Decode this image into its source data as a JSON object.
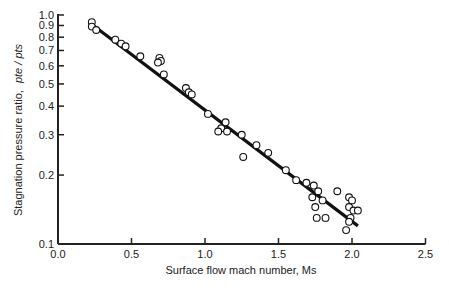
{
  "chart_data": {
    "type": "scatter",
    "title": "",
    "xlabel": "Surface flow mach number,  Ms",
    "ylabel": "Stagnation pressure ratio,  pte / pts",
    "ylabel_main": "Stagnation pressure ratio,",
    "ylabel_sym": "pte / pts",
    "xlim": [
      0,
      2.5
    ],
    "ylim": [
      0.1,
      1.0
    ],
    "yscale": "log",
    "grid": false,
    "legend": null,
    "x_ticks": [
      "0.0",
      "0.5",
      "1.0",
      "1.5",
      "2.0",
      "2.5"
    ],
    "y_ticks": [
      "1.0",
      "0.9",
      "0.8",
      "0.7",
      "0.6",
      "0.5",
      "0.4",
      "0.3",
      "0.2",
      "0.1"
    ],
    "fit_line": {
      "x": [
        0.22,
        2.04
      ],
      "y": [
        0.92,
        0.12
      ]
    },
    "series": [
      {
        "name": "data",
        "marker": "open-circle",
        "points": [
          [
            0.23,
            0.93
          ],
          [
            0.23,
            0.89
          ],
          [
            0.26,
            0.86
          ],
          [
            0.39,
            0.78
          ],
          [
            0.43,
            0.75
          ],
          [
            0.46,
            0.73
          ],
          [
            0.56,
            0.66
          ],
          [
            0.69,
            0.65
          ],
          [
            0.7,
            0.63
          ],
          [
            0.68,
            0.62
          ],
          [
            0.72,
            0.55
          ],
          [
            0.87,
            0.48
          ],
          [
            0.89,
            0.46
          ],
          [
            0.91,
            0.45
          ],
          [
            1.02,
            0.37
          ],
          [
            1.14,
            0.34
          ],
          [
            1.11,
            0.32
          ],
          [
            1.09,
            0.31
          ],
          [
            1.15,
            0.31
          ],
          [
            1.25,
            0.3
          ],
          [
            1.35,
            0.27
          ],
          [
            1.26,
            0.24
          ],
          [
            1.43,
            0.25
          ],
          [
            1.55,
            0.21
          ],
          [
            1.62,
            0.19
          ],
          [
            1.69,
            0.185
          ],
          [
            1.74,
            0.18
          ],
          [
            1.77,
            0.17
          ],
          [
            1.73,
            0.16
          ],
          [
            1.8,
            0.155
          ],
          [
            1.75,
            0.145
          ],
          [
            1.82,
            0.13
          ],
          [
            1.76,
            0.13
          ],
          [
            1.9,
            0.17
          ],
          [
            1.98,
            0.16
          ],
          [
            2.0,
            0.155
          ],
          [
            1.98,
            0.145
          ],
          [
            2.01,
            0.14
          ],
          [
            2.04,
            0.14
          ],
          [
            1.99,
            0.13
          ],
          [
            1.96,
            0.115
          ],
          [
            1.98,
            0.125
          ]
        ]
      }
    ]
  }
}
